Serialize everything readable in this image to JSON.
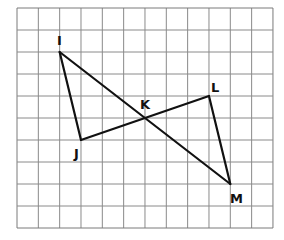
{
  "diagram": {
    "grid": {
      "origin_x": 17,
      "origin_y": 8,
      "cols": 12,
      "rows": 10,
      "cell_w": 21.33,
      "cell_h": 22,
      "line_color": "#8a8a8a",
      "border_color": "#7a7a7a"
    },
    "points": {
      "I": {
        "label": "I",
        "col": 2,
        "row": 2
      },
      "J": {
        "label": "J",
        "col": 3,
        "row": 6
      },
      "K": {
        "label": "K",
        "col": 6,
        "row": 5
      },
      "L": {
        "label": "L",
        "col": 9,
        "row": 4
      },
      "M": {
        "label": "M",
        "col": 10,
        "row": 8
      }
    },
    "segments": [
      [
        "I",
        "J"
      ],
      [
        "I",
        "M"
      ],
      [
        "J",
        "L"
      ],
      [
        "L",
        "M"
      ]
    ],
    "line_color": "#111111"
  }
}
